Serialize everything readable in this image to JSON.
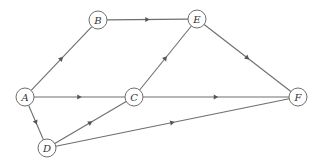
{
  "diagram": {
    "type": "directed-graph",
    "colors": {
      "edge": "#6e6e6e",
      "node_stroke": "#6e6e6e",
      "node_fill": "#ffffff",
      "label": "#333333"
    },
    "nodes": [
      {
        "id": "A",
        "label": "A",
        "x": 25,
        "y": 97
      },
      {
        "id": "B",
        "label": "B",
        "x": 98,
        "y": 20
      },
      {
        "id": "E",
        "label": "E",
        "x": 197,
        "y": 19
      },
      {
        "id": "C",
        "label": "C",
        "x": 134,
        "y": 97
      },
      {
        "id": "D",
        "label": "D",
        "x": 47,
        "y": 148
      },
      {
        "id": "F",
        "label": "F",
        "x": 298,
        "y": 97
      }
    ],
    "edges": [
      {
        "from": "A",
        "to": "B"
      },
      {
        "from": "A",
        "to": "C"
      },
      {
        "from": "A",
        "to": "D"
      },
      {
        "from": "B",
        "to": "E"
      },
      {
        "from": "C",
        "to": "E"
      },
      {
        "from": "C",
        "to": "F"
      },
      {
        "from": "E",
        "to": "F"
      },
      {
        "from": "D",
        "to": "C"
      },
      {
        "from": "D",
        "to": "F"
      }
    ]
  }
}
